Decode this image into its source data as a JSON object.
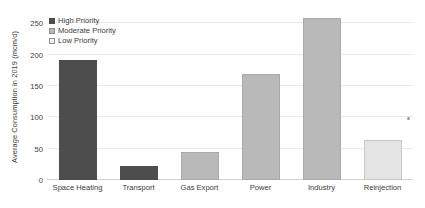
{
  "chart_data": {
    "type": "bar",
    "title": "",
    "xlabel": "",
    "ylabel": "Average Consumption in 2019 (mcm/d)",
    "categories": [
      "Space Heating",
      "Transport",
      "Gas Export",
      "Power",
      "Industry",
      "Reinjection"
    ],
    "values": [
      192,
      23,
      44,
      170,
      259,
      64
    ],
    "series": [
      {
        "name": "Average Consumption in 2019 (mcm/d)",
        "values": [
          192,
          23,
          44,
          170,
          259,
          64
        ],
        "priority": [
          "high",
          "high",
          "moderate",
          "moderate",
          "moderate",
          "low"
        ]
      }
    ],
    "ylim": [
      0,
      265
    ],
    "yticks": [
      0,
      50,
      100,
      150,
      200,
      250
    ],
    "ytick_labels": [
      "0",
      "50",
      "100",
      "150",
      "200",
      "250"
    ],
    "grid": true,
    "legend_position": "upper left",
    "legend": [
      {
        "label": "High Priority",
        "color": "#4d4d4d",
        "key": "high"
      },
      {
        "label": "Moderate Priority",
        "color": "#b9b9b9",
        "key": "moderate"
      },
      {
        "label": "Low Priority",
        "color": "#f4f4f4",
        "key": "low"
      }
    ],
    "colors": {
      "high": "#4d4d4d",
      "moderate": "#b9b9b9",
      "low": "#e4e4e4",
      "gridline": "#e9e9e9",
      "axis": "#cfcfcf",
      "text": "#3c3c3c",
      "background": "#ffffff"
    }
  }
}
